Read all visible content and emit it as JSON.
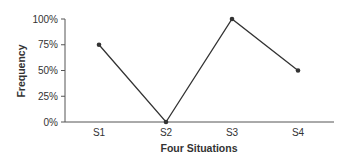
{
  "chart_data": {
    "type": "line",
    "title": "",
    "xlabel": "Four Situations",
    "ylabel": "Frequency",
    "categories": [
      "S1",
      "S2",
      "S3",
      "S4"
    ],
    "series": [
      {
        "name": "Frequency",
        "values": [
          75,
          0,
          100,
          50
        ]
      }
    ],
    "ylim": [
      0,
      100
    ],
    "yticks": [
      "0%",
      "25%",
      "50%",
      "75%",
      "100%"
    ],
    "grid": false,
    "legend": "none",
    "colors": {
      "line": "#333333",
      "axis": "#555555",
      "text": "#333333"
    }
  }
}
